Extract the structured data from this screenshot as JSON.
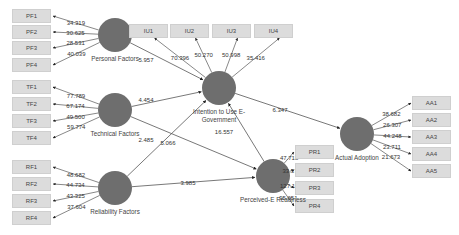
{
  "diagram": {
    "type": "sem-path-model",
    "colors": {
      "construct": "#6e6e6e",
      "indicator_bg": "#dcdcdc",
      "line": "#555555"
    },
    "constructs": [
      {
        "id": "PF",
        "label": "Personal Factors",
        "cx": 115,
        "cy": 35,
        "r": 17
      },
      {
        "id": "TF",
        "label": "Technical Factors",
        "cx": 115,
        "cy": 110,
        "r": 17
      },
      {
        "id": "RF",
        "label": "Reliability Factors",
        "cx": 115,
        "cy": 188,
        "r": 17
      },
      {
        "id": "IU",
        "label": "Intention to Use E-Government",
        "cx": 219,
        "cy": 88,
        "r": 17
      },
      {
        "id": "PR",
        "label": "Perceived-E Readiness",
        "cx": 273,
        "cy": 176,
        "r": 17
      },
      {
        "id": "AA",
        "label": "Actual Adoption",
        "cx": 357,
        "cy": 134,
        "r": 17
      }
    ],
    "indicators": [
      {
        "id": "PF1",
        "label": "PF1",
        "construct": "PF",
        "x": 12,
        "y": 9,
        "loading": "34.319"
      },
      {
        "id": "PF2",
        "label": "PF2",
        "construct": "PF",
        "x": 12,
        "y": 25,
        "loading": "30.625"
      },
      {
        "id": "PF3",
        "label": "PF3",
        "construct": "PF",
        "x": 12,
        "y": 41,
        "loading": "28.531"
      },
      {
        "id": "PF4",
        "label": "PF4",
        "construct": "PF",
        "x": 12,
        "y": 58,
        "loading": "40.039"
      },
      {
        "id": "TF1",
        "label": "TF1",
        "construct": "TF",
        "x": 12,
        "y": 80,
        "loading": "77.789"
      },
      {
        "id": "TF2",
        "label": "TF2",
        "construct": "TF",
        "x": 12,
        "y": 97,
        "loading": "67.174"
      },
      {
        "id": "TF3",
        "label": "TF3",
        "construct": "TF",
        "x": 12,
        "y": 114,
        "loading": "49.500"
      },
      {
        "id": "TF4",
        "label": "TF4",
        "construct": "TF",
        "x": 12,
        "y": 131,
        "loading": "59.774"
      },
      {
        "id": "RF1",
        "label": "RF1",
        "construct": "RF",
        "x": 12,
        "y": 160,
        "loading": "48.682"
      },
      {
        "id": "RF2",
        "label": "RF2",
        "construct": "RF",
        "x": 12,
        "y": 177,
        "loading": "44.734"
      },
      {
        "id": "RF3",
        "label": "RF3",
        "construct": "RF",
        "x": 12,
        "y": 194,
        "loading": "43.325"
      },
      {
        "id": "RF4",
        "label": "RF4",
        "construct": "RF",
        "x": 12,
        "y": 211,
        "loading": "37.604"
      },
      {
        "id": "IU1",
        "label": "IU1",
        "construct": "IU",
        "x": 129,
        "y": 24,
        "loading": "70.396"
      },
      {
        "id": "IU2",
        "label": "IU2",
        "construct": "IU",
        "x": 170,
        "y": 24,
        "loading": "50.270"
      },
      {
        "id": "IU3",
        "label": "IU3",
        "construct": "IU",
        "x": 212,
        "y": 24,
        "loading": "50.998"
      },
      {
        "id": "IU4",
        "label": "IU4",
        "construct": "IU",
        "x": 254,
        "y": 24,
        "loading": "35.416"
      },
      {
        "id": "PR1",
        "label": "PR1",
        "construct": "PR",
        "x": 295,
        "y": 145,
        "loading": "47.718"
      },
      {
        "id": "PR2",
        "label": "PR2",
        "construct": "PR",
        "x": 295,
        "y": 163,
        "loading": "33.370"
      },
      {
        "id": "PR3",
        "label": "PR3",
        "construct": "PR",
        "x": 295,
        "y": 181,
        "loading": "127.177"
      },
      {
        "id": "PR4",
        "label": "PR4",
        "construct": "PR",
        "x": 295,
        "y": 199,
        "loading": "95.651"
      },
      {
        "id": "AA1",
        "label": "AA1",
        "construct": "AA",
        "x": 412,
        "y": 96,
        "loading": "38.682"
      },
      {
        "id": "AA2",
        "label": "AA2",
        "construct": "AA",
        "x": 412,
        "y": 113,
        "loading": "26.307"
      },
      {
        "id": "AA3",
        "label": "AA3",
        "construct": "AA",
        "x": 412,
        "y": 130,
        "loading": "44.248"
      },
      {
        "id": "AA4",
        "label": "AA4",
        "construct": "AA",
        "x": 412,
        "y": 147,
        "loading": "23.711"
      },
      {
        "id": "AA5",
        "label": "AA5",
        "construct": "AA",
        "x": 412,
        "y": 164,
        "loading": "21.673"
      }
    ],
    "paths": [
      {
        "from": "PF",
        "to": "IU",
        "value": "5.957",
        "lx": 146,
        "ly": 62
      },
      {
        "from": "TF",
        "to": "IU",
        "value": "4.454",
        "lx": 146,
        "ly": 102
      },
      {
        "from": "TF",
        "to": "PR",
        "value": "2.485",
        "lx": 146,
        "ly": 142
      },
      {
        "from": "RF",
        "to": "IU",
        "value": "5.066",
        "lx": 168,
        "ly": 145
      },
      {
        "from": "RF",
        "to": "PR",
        "value": "3.985",
        "lx": 188,
        "ly": 185
      },
      {
        "from": "PR",
        "to": "IU",
        "value": "16.557",
        "lx": 224,
        "ly": 134
      },
      {
        "from": "IU",
        "to": "AA",
        "value": "6.347",
        "lx": 280,
        "ly": 112
      }
    ]
  }
}
